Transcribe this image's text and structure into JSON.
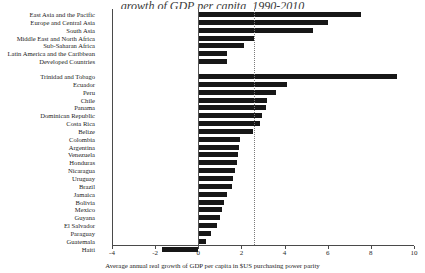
{
  "title_fragment": "growth of GDP per capita, 1990-2010",
  "axis": {
    "xlabel": "Average annual real growth of GDP per capita in $US purchasing power parity",
    "ticks": [
      -4,
      -2,
      0,
      2,
      4,
      6,
      8,
      10
    ],
    "xmin": -4,
    "xmax": 10,
    "reference_line": 2.6,
    "grid": false
  },
  "chart_data": {
    "type": "bar",
    "orientation": "horizontal",
    "title": "growth of GDP per capita, 1990-2010",
    "xlabel": "Average annual real growth of GDP per capita in $US purchasing power parity",
    "ylabel": "",
    "xlim": [
      -4,
      10
    ],
    "grid": false,
    "legend": "none",
    "reference_line": 2.6,
    "groups": [
      {
        "name": "regions",
        "categories": [
          "East Asia and the Pacific",
          "Europe and Central Asia",
          "South Asia",
          "Middle East and North Africa",
          "Sub-Saharan Africa",
          "Latin America and the Caribbean",
          "Developed Countries"
        ],
        "values": [
          7.55,
          6.0,
          5.3,
          2.6,
          2.1,
          1.35,
          1.35
        ]
      },
      {
        "name": "countries",
        "categories": [
          "Trinidad and Tobago",
          "Ecuador",
          "Peru",
          "Chile",
          "Panama",
          "Dominican Republic",
          "Costa Rica",
          "Belize",
          "Colombia",
          "Argentina",
          "Venezuela",
          "Honduras",
          "Nicaragua",
          "Uruguay",
          "Brazil",
          "Jamaica",
          "Bolivia",
          "Mexico",
          "Guyana",
          "El Salvador",
          "Paraguay",
          "Guatemala",
          "Haiti"
        ],
        "values": [
          9.2,
          4.1,
          3.6,
          3.2,
          3.15,
          2.95,
          2.85,
          2.55,
          1.95,
          1.9,
          1.85,
          1.8,
          1.7,
          1.6,
          1.55,
          1.35,
          1.2,
          1.1,
          1.0,
          0.85,
          0.6,
          0.35,
          -1.7
        ]
      }
    ]
  }
}
